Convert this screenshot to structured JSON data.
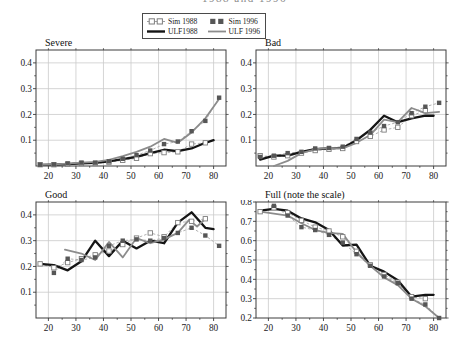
{
  "figure": {
    "cropped_title": "1988 and 1996",
    "background": "#ffffff",
    "grid_color": "#cacaca",
    "frame_color": "#3c3c3c",
    "text_color": "#1a1a1a"
  },
  "legend": {
    "entries": [
      {
        "label": "Sim 1988",
        "marker": "open-square-dashed",
        "color": "#7d7d7d"
      },
      {
        "label": "Sim 1996",
        "marker": "filled-square",
        "color": "#565656"
      },
      {
        "label": "ULF1988",
        "marker": "thick-black-line",
        "color": "#151515"
      },
      {
        "label": "ULF 1996",
        "marker": "gray-line",
        "color": "#8c8c8c"
      }
    ]
  },
  "chart_data": [
    {
      "type": "line",
      "title": "Severe",
      "xlim": [
        15.5,
        84.5
      ],
      "ylim": [
        0,
        0.45
      ],
      "xticks": [
        20,
        30,
        40,
        50,
        60,
        70,
        80
      ],
      "yticks": [
        0.1,
        0.2,
        0.3,
        0.4
      ],
      "ytick_labels": [
        "0.1",
        "0.2",
        "0.3",
        "0.4"
      ],
      "grid": true,
      "series": [
        {
          "name": "Sim 1988",
          "style": "open-square",
          "color": "#7d7d7d",
          "x": [
            17,
            22,
            27,
            32,
            37,
            42,
            47,
            52,
            57,
            62,
            67,
            72,
            77
          ],
          "y": [
            0.005,
            0.005,
            0.007,
            0.01,
            0.01,
            0.015,
            0.022,
            0.03,
            0.048,
            0.052,
            0.055,
            0.085,
            0.09
          ]
        },
        {
          "name": "Sim 1996",
          "style": "filled-square",
          "color": "#565656",
          "x": [
            17,
            22,
            27,
            32,
            37,
            42,
            47,
            52,
            57,
            62,
            67,
            72,
            77,
            82
          ],
          "y": [
            0.005,
            0.006,
            0.01,
            0.013,
            0.013,
            0.018,
            0.028,
            0.042,
            0.06,
            0.085,
            0.095,
            0.135,
            0.175,
            0.265
          ]
        },
        {
          "name": "ULF1988",
          "style": "thick-black-line",
          "color": "#151515",
          "x": [
            17,
            22,
            27,
            32,
            37,
            42,
            47,
            52,
            57,
            62,
            67,
            72,
            77,
            80
          ],
          "y": [
            0.004,
            0.005,
            0.007,
            0.01,
            0.012,
            0.018,
            0.027,
            0.035,
            0.05,
            0.063,
            0.058,
            0.068,
            0.09,
            0.1
          ]
        },
        {
          "name": "ULF 1996",
          "style": "gray-line",
          "color": "#8c8c8c",
          "x": [
            17,
            22,
            27,
            32,
            37,
            42,
            47,
            52,
            57,
            62,
            67,
            72,
            77,
            82
          ],
          "y": [
            0.004,
            0.006,
            0.009,
            0.013,
            0.016,
            0.024,
            0.038,
            0.055,
            0.075,
            0.105,
            0.09,
            0.13,
            0.185,
            0.26
          ]
        }
      ]
    },
    {
      "type": "line",
      "title": "Bad",
      "xlim": [
        15.5,
        84.5
      ],
      "ylim": [
        0,
        0.45
      ],
      "xticks": [
        20,
        30,
        40,
        50,
        60,
        70,
        80
      ],
      "yticks": [
        0.1,
        0.2,
        0.3,
        0.4
      ],
      "ytick_labels": [
        "0.1",
        "0.2",
        "0.3",
        "0.4"
      ],
      "grid": true,
      "series": [
        {
          "name": "Sim 1988",
          "style": "open-square",
          "color": "#7d7d7d",
          "x": [
            17,
            22,
            27,
            32,
            37,
            42,
            47,
            52,
            57,
            62,
            67,
            72,
            77
          ],
          "y": [
            0.04,
            0.035,
            0.04,
            0.05,
            0.06,
            0.065,
            0.068,
            0.095,
            0.115,
            0.14,
            0.15,
            0.195,
            0.215
          ]
        },
        {
          "name": "Sim 1996",
          "style": "filled-square",
          "color": "#565656",
          "x": [
            17,
            22,
            27,
            32,
            37,
            42,
            47,
            52,
            57,
            62,
            67,
            72,
            77,
            82
          ],
          "y": [
            0.035,
            0.04,
            0.05,
            0.055,
            0.068,
            0.07,
            0.075,
            0.105,
            0.13,
            0.155,
            0.17,
            0.205,
            0.23,
            0.245
          ]
        },
        {
          "name": "ULF1988",
          "style": "thick-black-line",
          "color": "#151515",
          "x": [
            17,
            22,
            27,
            32,
            37,
            42,
            47,
            52,
            57,
            62,
            67,
            72,
            77,
            80
          ],
          "y": [
            0.025,
            0.04,
            0.04,
            0.055,
            0.065,
            0.068,
            0.07,
            0.1,
            0.14,
            0.195,
            0.17,
            0.185,
            0.195,
            0.195
          ]
        },
        {
          "name": "ULF 1996",
          "style": "gray-line",
          "color": "#8c8c8c",
          "x": [
            22,
            27,
            32,
            37,
            42,
            47,
            52,
            57,
            62,
            67,
            72,
            77,
            82
          ],
          "y": [
            0.0,
            0.02,
            0.05,
            0.065,
            0.07,
            0.068,
            0.09,
            0.12,
            0.18,
            0.17,
            0.225,
            0.205,
            0.21
          ]
        }
      ]
    },
    {
      "type": "line",
      "title": "Good",
      "xlim": [
        15.5,
        84.5
      ],
      "ylim": [
        0,
        0.45
      ],
      "xticks": [
        20,
        30,
        40,
        50,
        60,
        70,
        80
      ],
      "yticks": [
        0.1,
        0.2,
        0.3,
        0.4
      ],
      "ytick_labels": [
        "0.1",
        "0.2",
        "0.3",
        "0.4"
      ],
      "grid": true,
      "series": [
        {
          "name": "Sim 1988",
          "style": "open-square",
          "color": "#7d7d7d",
          "x": [
            17,
            22,
            27,
            32,
            37,
            42,
            47,
            52,
            57,
            62,
            67,
            72,
            77
          ],
          "y": [
            0.21,
            0.195,
            0.215,
            0.23,
            0.245,
            0.26,
            0.285,
            0.31,
            0.33,
            0.315,
            0.37,
            0.375,
            0.385
          ]
        },
        {
          "name": "Sim 1996",
          "style": "filled-square",
          "color": "#565656",
          "x": [
            22,
            27,
            32,
            37,
            42,
            47,
            52,
            57,
            62,
            67,
            72,
            77,
            82
          ],
          "y": [
            0.175,
            0.23,
            0.225,
            0.235,
            0.28,
            0.3,
            0.305,
            0.3,
            0.31,
            0.33,
            0.35,
            0.32,
            0.28
          ]
        },
        {
          "name": "ULF1988",
          "style": "thick-black-line",
          "color": "#151515",
          "x": [
            17,
            22,
            27,
            32,
            37,
            42,
            47,
            52,
            57,
            62,
            67,
            72,
            77,
            80
          ],
          "y": [
            0.21,
            0.205,
            0.185,
            0.22,
            0.3,
            0.24,
            0.3,
            0.27,
            0.3,
            0.29,
            0.37,
            0.41,
            0.35,
            0.345
          ]
        },
        {
          "name": "ULF 1996",
          "style": "gray-line",
          "color": "#8c8c8c",
          "x": [
            26,
            32,
            37,
            42,
            47,
            52,
            57,
            62,
            67,
            71,
            74,
            77
          ],
          "y": [
            0.265,
            0.25,
            0.225,
            0.295,
            0.235,
            0.31,
            0.29,
            0.305,
            0.33,
            0.38,
            0.355,
            0.385
          ]
        }
      ]
    },
    {
      "type": "line",
      "title": "Full (note the scale)",
      "xlim": [
        15.5,
        84.5
      ],
      "ylim": [
        0.2,
        0.8
      ],
      "xticks": [
        20,
        30,
        40,
        50,
        60,
        70,
        80
      ],
      "yticks": [
        0.2,
        0.3,
        0.4,
        0.5,
        0.6,
        0.7,
        0.8
      ],
      "ytick_labels": [
        "0.2",
        "0.3",
        "0.4",
        "0.5",
        "0.6",
        "0.7",
        "0.8"
      ],
      "grid": true,
      "series": [
        {
          "name": "Sim 1988",
          "style": "open-square",
          "color": "#7d7d7d",
          "x": [
            17,
            22,
            27,
            32,
            37,
            42,
            47,
            52,
            57,
            62,
            67,
            72,
            77
          ],
          "y": [
            0.75,
            0.77,
            0.745,
            0.705,
            0.67,
            0.65,
            0.62,
            0.545,
            0.475,
            0.425,
            0.385,
            0.31,
            0.3
          ]
        },
        {
          "name": "Sim 1996",
          "style": "filled-square",
          "color": "#565656",
          "x": [
            22,
            27,
            32,
            37,
            42,
            47,
            52,
            57,
            62,
            67,
            72,
            77,
            82
          ],
          "y": [
            0.78,
            0.73,
            0.67,
            0.655,
            0.63,
            0.59,
            0.53,
            0.47,
            0.415,
            0.38,
            0.3,
            0.27,
            0.2
          ]
        },
        {
          "name": "ULF1988",
          "style": "thick-black-line",
          "color": "#151515",
          "x": [
            17,
            22,
            27,
            32,
            37,
            42,
            47,
            52,
            57,
            62,
            67,
            72,
            77,
            80
          ],
          "y": [
            0.755,
            0.765,
            0.755,
            0.715,
            0.695,
            0.655,
            0.575,
            0.58,
            0.47,
            0.44,
            0.395,
            0.31,
            0.32,
            0.32
          ]
        },
        {
          "name": "ULF 1996",
          "style": "gray-line",
          "color": "#8c8c8c",
          "x": [
            17,
            22,
            27,
            32,
            37,
            42,
            47,
            52,
            57,
            62,
            67,
            72,
            77,
            82
          ],
          "y": [
            0.75,
            0.74,
            0.73,
            0.69,
            0.655,
            0.64,
            0.635,
            0.54,
            0.47,
            0.41,
            0.37,
            0.3,
            0.26,
            0.2
          ]
        }
      ]
    }
  ]
}
